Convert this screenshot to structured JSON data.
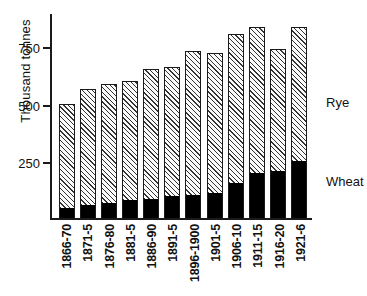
{
  "chart_data": {
    "type": "bar",
    "stacked": true,
    "title": "",
    "subtitle": "",
    "xlabel": "",
    "ylabel": "Thousand tonnes",
    "ylim": [
      0,
      900
    ],
    "yticks": [
      250,
      500,
      750
    ],
    "ytick_labels": [
      "250",
      "500",
      "750"
    ],
    "grid": false,
    "legend_position": "right-inline-annotations",
    "categories": [
      "1866-70",
      "1871-5",
      "1876-80",
      "1881-5",
      "1886-90",
      "1891-5",
      "1896-1900",
      "1901-5",
      "1906-10",
      "1911-15",
      "1916-20",
      "1921-6"
    ],
    "series": [
      {
        "name": "Wheat",
        "fill": "solid-black",
        "color": "#000000",
        "values": [
          45,
          55,
          65,
          80,
          85,
          95,
          100,
          110,
          155,
          195,
          205,
          250
        ]
      },
      {
        "name": "Rye",
        "fill": "diagonal-hatch",
        "color": "#f2f2f2",
        "values": [
          455,
          510,
          520,
          520,
          565,
          565,
          630,
          610,
          650,
          640,
          535,
          585
        ]
      }
    ],
    "totals": [
      500,
      565,
      585,
      600,
      650,
      660,
      730,
      720,
      805,
      835,
      740,
      835
    ],
    "annotations": [
      {
        "text": "Rye",
        "target_series": "Rye"
      },
      {
        "text": "Wheat",
        "target_series": "Wheat"
      }
    ]
  }
}
